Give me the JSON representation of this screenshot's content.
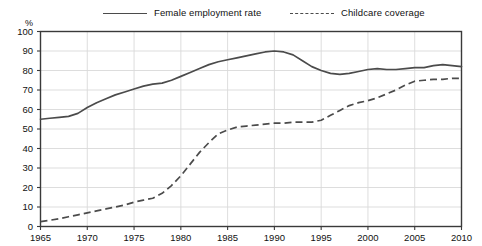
{
  "legend": {
    "items": [
      {
        "label": "Female employment rate",
        "style": "solid",
        "color": "#4b4b4b",
        "icon": "line-solid-icon"
      },
      {
        "label": "Childcare coverage",
        "style": "dashed",
        "color": "#4b4b4b",
        "icon": "line-dashed-icon"
      }
    ]
  },
  "axis": {
    "unit_label": "%",
    "y_ticks": [
      "100",
      "90",
      "80",
      "70",
      "60",
      "50",
      "40",
      "30",
      "20",
      "10",
      "0"
    ],
    "x_ticks": [
      "1965",
      "1970",
      "1975",
      "1980",
      "1985",
      "1990",
      "1995",
      "2000",
      "2005",
      "2010"
    ]
  },
  "colors": {
    "line": "#4b4b4b",
    "grid": "#d9d9d9",
    "frame": "#3a3a3a",
    "text": "#111111",
    "background": "#ffffff"
  },
  "chart_data": {
    "type": "line",
    "title": "",
    "subtitle": "",
    "xlabel": "",
    "ylabel": "%",
    "xlim": [
      1965,
      2010
    ],
    "ylim": [
      0,
      100
    ],
    "y_tick_step": 10,
    "x_tick_step": 5,
    "grid": "horizontal-and-vertical",
    "legend_position": "top",
    "x": [
      1965,
      1966,
      1967,
      1968,
      1969,
      1970,
      1971,
      1972,
      1973,
      1974,
      1975,
      1976,
      1977,
      1978,
      1979,
      1980,
      1981,
      1982,
      1983,
      1984,
      1985,
      1986,
      1987,
      1988,
      1989,
      1990,
      1991,
      1992,
      1993,
      1994,
      1995,
      1996,
      1997,
      1998,
      1999,
      2000,
      2001,
      2002,
      2003,
      2004,
      2005,
      2006,
      2007,
      2008,
      2009,
      2010
    ],
    "series": [
      {
        "name": "Female employment rate",
        "style": "solid",
        "color": "#4b4b4b",
        "values": [
          55,
          55.5,
          56,
          56.5,
          58,
          61,
          63.5,
          65.5,
          67.5,
          69,
          70.5,
          72,
          73,
          73.5,
          75,
          77,
          79,
          81,
          83,
          84.5,
          85.5,
          86.5,
          87.5,
          88.5,
          89.5,
          90,
          89.5,
          88,
          85,
          82,
          80,
          78.5,
          78,
          78.5,
          79.5,
          80.5,
          81,
          80.5,
          80.5,
          81,
          81.5,
          81.5,
          82.5,
          83,
          82.5,
          82
        ]
      },
      {
        "name": "Childcare coverage",
        "style": "dashed",
        "color": "#4b4b4b",
        "values": [
          2.5,
          3.2,
          4,
          5,
          6,
          7,
          8,
          9,
          10,
          11,
          12.5,
          13.5,
          14.5,
          17,
          21,
          26,
          32,
          38,
          43,
          47.5,
          49.5,
          51,
          51.5,
          52,
          52.5,
          53,
          53,
          53.5,
          53.5,
          53.5,
          54.5,
          57,
          59.5,
          62,
          63.5,
          64.5,
          66,
          68,
          70,
          72.5,
          74.5,
          75,
          75.5,
          75.5,
          76,
          76
        ]
      }
    ]
  }
}
